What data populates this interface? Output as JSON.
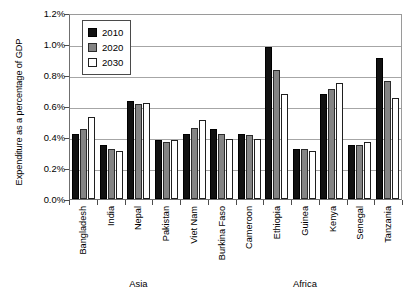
{
  "chart_data": {
    "type": "bar",
    "title": "",
    "subtitle": "",
    "xlabel": "",
    "ylabel": "Expenditure as a percentage of GDP",
    "ylim": [
      0,
      1.2
    ],
    "ytick_step": 0.2,
    "ytick_labels": [
      "0.0%",
      "0.2%",
      "0.4%",
      "0.6%",
      "0.8%",
      "1.0%",
      "1.2%"
    ],
    "ytick_values": [
      0.0,
      0.2,
      0.4,
      0.6,
      0.8,
      1.0,
      1.2
    ],
    "grid": true,
    "grid_axis": "y",
    "legend_position": "top-left-inside",
    "value_unit": "%",
    "categories": [
      "Bangladesh",
      "India",
      "Nepal",
      "Pakistan",
      "Viet Nam",
      "Burkina Faso",
      "Cameroon",
      "Ethiopia",
      "Guinea",
      "Kenya",
      "Senegal",
      "Tanzania"
    ],
    "series": [
      {
        "name": "2010",
        "color": "#111111",
        "values": [
          0.42,
          0.35,
          0.63,
          0.38,
          0.42,
          0.45,
          0.42,
          0.98,
          0.32,
          0.68,
          0.35,
          0.91
        ]
      },
      {
        "name": "2020",
        "color": "#848484",
        "values": [
          0.45,
          0.32,
          0.61,
          0.37,
          0.46,
          0.42,
          0.41,
          0.83,
          0.32,
          0.71,
          0.35,
          0.76
        ]
      },
      {
        "name": "2030",
        "color": "#ffffff",
        "values": [
          0.53,
          0.31,
          0.62,
          0.38,
          0.51,
          0.39,
          0.39,
          0.68,
          0.31,
          0.75,
          0.37,
          0.65
        ]
      }
    ],
    "region_groups": [
      {
        "label": "Asia",
        "categories": [
          "Bangladesh",
          "India",
          "Nepal",
          "Pakistan",
          "Viet Nam"
        ]
      },
      {
        "label": "Africa",
        "categories": [
          "Burkina Faso",
          "Cameroon",
          "Ethiopia",
          "Guinea",
          "Kenya",
          "Senegal",
          "Tanzania"
        ]
      }
    ]
  },
  "legend": {
    "items": [
      {
        "label": "2010",
        "swatch": "black-square-swatch"
      },
      {
        "label": "2020",
        "swatch": "gray-square-swatch"
      },
      {
        "label": "2030",
        "swatch": "white-square-swatch"
      }
    ]
  }
}
